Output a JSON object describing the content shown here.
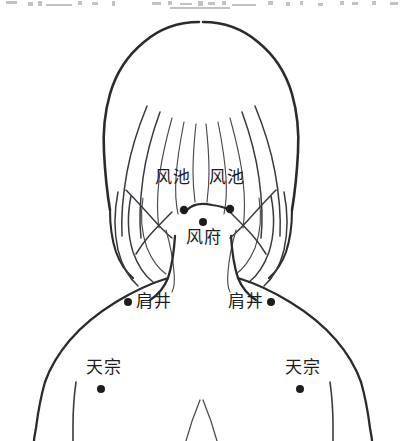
{
  "figure": {
    "background_color": "#ffffff",
    "ink_color": "#2b2b2e",
    "dot_color": "#1d1d20"
  },
  "acupoints": [
    {
      "id": "fengchi-left",
      "label": "风池",
      "label_x": 155,
      "label_y": 168,
      "dot_x": 184,
      "dot_y": 210,
      "dot_r": 4.2
    },
    {
      "id": "fengchi-right",
      "label": "风池",
      "label_x": 209,
      "label_y": 168,
      "dot_x": 230,
      "dot_y": 209,
      "dot_r": 4.2
    },
    {
      "id": "fengfu",
      "label": "风府",
      "label_x": 186,
      "label_y": 228,
      "dot_x": 203,
      "dot_y": 222,
      "dot_r": 4.0
    },
    {
      "id": "jianjing-left",
      "label": "肩井",
      "label_x": 136,
      "label_y": 292,
      "dot_x": 128,
      "dot_y": 302,
      "dot_r": 4.0
    },
    {
      "id": "jianjing-right",
      "label": "肩井",
      "label_x": 228,
      "label_y": 292,
      "dot_x": 271,
      "dot_y": 302,
      "dot_r": 4.0
    },
    {
      "id": "tianzong-left",
      "label": "天宗",
      "label_x": 86,
      "label_y": 358,
      "dot_x": 101,
      "dot_y": 389,
      "dot_r": 4.0
    },
    {
      "id": "tianzong-right",
      "label": "天宗",
      "label_x": 285,
      "label_y": 358,
      "dot_x": 300,
      "dot_y": 389,
      "dot_r": 4.0
    }
  ],
  "scan_artifacts": {
    "present": true,
    "description": "partial cut-off row of text at the very top edge of the scanned page",
    "fragments": [
      {
        "x": 6,
        "y": 1,
        "w": 11,
        "h": 3
      },
      {
        "x": 28,
        "y": 2,
        "w": 5,
        "h": 4
      },
      {
        "x": 38,
        "y": 1,
        "w": 4,
        "h": 5
      },
      {
        "x": 46,
        "y": 4,
        "w": 26,
        "h": 2
      },
      {
        "x": 78,
        "y": 1,
        "w": 4,
        "h": 4
      },
      {
        "x": 92,
        "y": 2,
        "w": 6,
        "h": 3
      },
      {
        "x": 112,
        "y": 1,
        "w": 3,
        "h": 5
      },
      {
        "x": 152,
        "y": 2,
        "w": 9,
        "h": 3
      },
      {
        "x": 168,
        "y": 1,
        "w": 4,
        "h": 4
      },
      {
        "x": 180,
        "y": 3,
        "w": 12,
        "h": 2
      },
      {
        "x": 198,
        "y": 1,
        "w": 5,
        "h": 5
      },
      {
        "x": 208,
        "y": 2,
        "w": 7,
        "h": 3
      },
      {
        "x": 222,
        "y": 1,
        "w": 4,
        "h": 4
      },
      {
        "x": 232,
        "y": 4,
        "w": 24,
        "h": 2
      },
      {
        "x": 268,
        "y": 1,
        "w": 5,
        "h": 4
      },
      {
        "x": 286,
        "y": 2,
        "w": 4,
        "h": 4
      },
      {
        "x": 300,
        "y": 1,
        "w": 3,
        "h": 4
      },
      {
        "x": 318,
        "y": 3,
        "w": 5,
        "h": 3
      },
      {
        "x": 340,
        "y": 1,
        "w": 4,
        "h": 4
      },
      {
        "x": 352,
        "y": 2,
        "w": 6,
        "h": 3
      },
      {
        "x": 372,
        "y": 1,
        "w": 4,
        "h": 4
      },
      {
        "x": 390,
        "y": 2,
        "w": 8,
        "h": 3
      },
      {
        "x": 170,
        "y": 7,
        "w": 60,
        "h": 2
      }
    ]
  }
}
